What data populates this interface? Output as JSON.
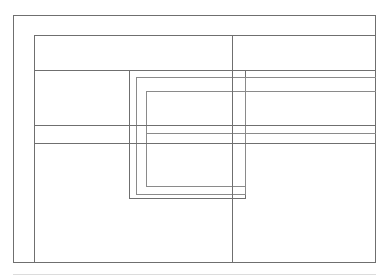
{
  "diagram": {
    "type": "wireframe-outline",
    "canvas": {
      "width": 390,
      "height": 280,
      "background": "#ffffff"
    },
    "style": {
      "stroke": "#6f6f6f",
      "stroke_soft": "#8a8a8a",
      "stroke_faint": "#dcdcdc",
      "stroke_width": 1,
      "fill": "none"
    },
    "shapes": [
      {
        "id": "outer-frame",
        "label": "Outer frame",
        "kind": "rect",
        "x": 13,
        "y": 15,
        "width": 363,
        "height": 248
      },
      {
        "id": "content-frame",
        "label": "Content frame",
        "kind": "rect",
        "x": 34,
        "y": 35,
        "width": 342,
        "height": 228
      },
      {
        "id": "panel-outer",
        "label": "Panel outer",
        "kind": "rect",
        "x": 129,
        "y": 70,
        "width": 117,
        "height": 129
      },
      {
        "id": "panel-middle",
        "label": "Panel middle",
        "kind": "rect",
        "x": 136,
        "y": 77,
        "width": 110,
        "height": 118
      },
      {
        "id": "panel-inner",
        "label": "Panel inner",
        "kind": "rect",
        "x": 146,
        "y": 91,
        "width": 100,
        "height": 96
      }
    ],
    "rules": [
      {
        "id": "rule-header-bottom",
        "label": "Header divider",
        "kind": "hline",
        "x": 34,
        "y": 70,
        "length": 342
      },
      {
        "id": "rule-panel-top-right",
        "label": "Panel top extension right",
        "kind": "hline",
        "x": 246,
        "y": 77,
        "length": 130
      },
      {
        "id": "rule-panel-inner-top-right",
        "label": "Panel inner top extension right",
        "kind": "hline",
        "x": 246,
        "y": 91,
        "length": 130
      },
      {
        "id": "rule-mid-upper",
        "label": "Mid divider upper",
        "kind": "hline",
        "x": 34,
        "y": 125,
        "length": 342
      },
      {
        "id": "rule-mid-center",
        "label": "Mid divider center",
        "kind": "hline",
        "x": 146,
        "y": 133,
        "length": 230
      },
      {
        "id": "rule-mid-lower",
        "label": "Mid divider lower",
        "kind": "hline",
        "x": 34,
        "y": 143,
        "length": 342
      },
      {
        "id": "rule-column-divider",
        "label": "Column divider",
        "kind": "vline",
        "x": 232,
        "y": 35,
        "length": 228
      },
      {
        "id": "rule-baseline",
        "label": "Page baseline",
        "kind": "baseline",
        "x": 13,
        "y": 274,
        "length": 363
      }
    ]
  }
}
